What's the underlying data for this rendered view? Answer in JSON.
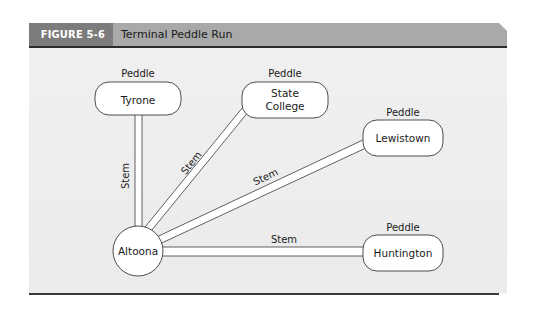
{
  "figure": {
    "label": "FIGURE 5-6",
    "title": "Terminal Peddle Run"
  },
  "diagram": {
    "hub": {
      "name": "Altoona"
    },
    "nodes": [
      {
        "id": "tyrone",
        "name": "Tyrone",
        "type_label": "Peddle"
      },
      {
        "id": "state-college",
        "name_line1": "State",
        "name_line2": "College",
        "type_label": "Peddle"
      },
      {
        "id": "lewistown",
        "name": "Lewistown",
        "type_label": "Peddle"
      },
      {
        "id": "huntington",
        "name": "Huntington",
        "type_label": "Peddle"
      }
    ],
    "edges": [
      {
        "from": "Altoona",
        "to": "Tyrone",
        "label": "Stem"
      },
      {
        "from": "Altoona",
        "to": "State College",
        "label": "Stem"
      },
      {
        "from": "Altoona",
        "to": "Lewistown",
        "label": "Stem"
      },
      {
        "from": "Altoona",
        "to": "Huntington",
        "label": "Stem"
      }
    ]
  }
}
